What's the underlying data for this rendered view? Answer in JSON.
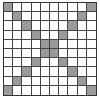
{
  "grid": {
    "rows": 10,
    "cols": 10,
    "fill_color": "#9a9a9a",
    "empty_color": "#ffffff",
    "line_color": "#444444",
    "filled_cells": [
      [
        0,
        0
      ],
      [
        0,
        9
      ],
      [
        1,
        1
      ],
      [
        1,
        8
      ],
      [
        2,
        2
      ],
      [
        2,
        7
      ],
      [
        3,
        3
      ],
      [
        3,
        6
      ],
      [
        4,
        4
      ],
      [
        4,
        5
      ],
      [
        5,
        4
      ],
      [
        5,
        5
      ],
      [
        6,
        3
      ],
      [
        6,
        6
      ],
      [
        7,
        2
      ],
      [
        7,
        7
      ],
      [
        8,
        1
      ],
      [
        8,
        8
      ],
      [
        9,
        0
      ],
      [
        9,
        9
      ]
    ]
  }
}
